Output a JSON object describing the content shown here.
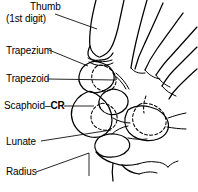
{
  "figure": {
    "background_color": "#ffffff",
    "line_color": "#000000"
  },
  "labels": {
    "thumb": "Thumb",
    "thumb_sub": "(1st digit)",
    "trapezium": "Trapezium",
    "trapezoid": "Trapezoid",
    "scaphoid_name": "Scaphoid",
    "scaphoid_dash": "–",
    "scaphoid_cr": "CR",
    "lunate": "Lunate",
    "radius": "Radius"
  },
  "structures": [
    {
      "name": "thumb",
      "label": "Thumb (1st digit)"
    },
    {
      "name": "trapezium",
      "label": "Trapezium"
    },
    {
      "name": "trapezoid",
      "label": "Trapezoid"
    },
    {
      "name": "scaphoid",
      "label": "Scaphoid–CR"
    },
    {
      "name": "lunate",
      "label": "Lunate"
    },
    {
      "name": "radius",
      "label": "Radius"
    }
  ]
}
